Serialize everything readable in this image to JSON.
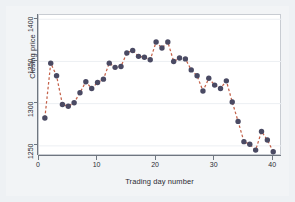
{
  "chart_data": {
    "type": "scatter",
    "title": "",
    "xlabel": "Trading day number",
    "ylabel": "Closing price",
    "xlim": [
      0,
      41.5
    ],
    "ylim": [
      1238,
      1405
    ],
    "xticks": [
      0,
      10,
      20,
      30,
      40
    ],
    "yticks": [
      1250,
      1300,
      1350,
      1400
    ],
    "grid": true,
    "grid_axis": "y",
    "legend": "none",
    "marker": "filled-circle",
    "marker_color": "#4a4a63",
    "line_style": "dashed",
    "line_color": "#c4624a",
    "x": [
      1,
      2,
      3,
      4,
      5,
      6,
      7,
      8,
      9,
      10,
      11,
      12,
      13,
      14,
      15,
      16,
      17,
      18,
      19,
      20,
      21,
      22,
      23,
      24,
      25,
      26,
      27,
      28,
      29,
      30,
      31,
      32,
      33,
      34,
      35,
      36,
      37,
      38,
      39,
      40
    ],
    "y": [
      1283,
      1348,
      1333,
      1299,
      1297,
      1301,
      1313,
      1326,
      1318,
      1325,
      1329,
      1348,
      1343,
      1344,
      1360,
      1363,
      1356,
      1355,
      1352,
      1373,
      1366,
      1373,
      1350,
      1354,
      1353,
      1340,
      1333,
      1315,
      1330,
      1322,
      1318,
      1327,
      1302,
      1279,
      1255,
      1252,
      1245,
      1267,
      1257,
      1243
    ],
    "series": [
      {
        "name": "Closing price",
        "values": [
          1283,
          1348,
          1333,
          1299,
          1297,
          1301,
          1313,
          1326,
          1318,
          1325,
          1329,
          1348,
          1343,
          1344,
          1360,
          1363,
          1356,
          1355,
          1352,
          1373,
          1366,
          1373,
          1350,
          1354,
          1353,
          1340,
          1333,
          1315,
          1330,
          1322,
          1318,
          1327,
          1302,
          1279,
          1255,
          1252,
          1245,
          1267,
          1257,
          1243
        ]
      }
    ]
  },
  "axes": {
    "y_label": "Closing price",
    "x_label": "Trading day number",
    "y_tick_labels": [
      "1400",
      "1350",
      "1300",
      "1250"
    ],
    "x_tick_labels": [
      "0",
      "10",
      "20",
      "30",
      "40"
    ]
  },
  "colors": {
    "background": "#eef1f4",
    "panel": "#f2f4f6",
    "plot_background": "#ffffff",
    "axis": "#6f7680",
    "grid": "#eceff3",
    "marker": "#4a4a63",
    "line": "#c4624a",
    "text": "#2b2b33"
  }
}
